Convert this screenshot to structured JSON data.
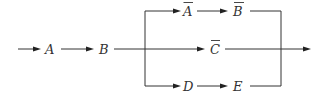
{
  "diagram": {
    "type": "reliability-block-diagram",
    "nodes": [
      {
        "id": "A",
        "label": "A",
        "complement": false
      },
      {
        "id": "B",
        "label": "B",
        "complement": false
      },
      {
        "id": "A_bar",
        "label": "A",
        "complement": true
      },
      {
        "id": "B_bar",
        "label": "B",
        "complement": true
      },
      {
        "id": "C_bar",
        "label": "C",
        "complement": true
      },
      {
        "id": "D",
        "label": "D",
        "complement": false
      },
      {
        "id": "E",
        "label": "E",
        "complement": false
      }
    ],
    "edges": [
      [
        "input",
        "A"
      ],
      [
        "A",
        "B"
      ],
      [
        "B",
        "A_bar"
      ],
      [
        "A_bar",
        "B_bar"
      ],
      [
        "B",
        "C_bar"
      ],
      [
        "B",
        "D"
      ],
      [
        "D",
        "E"
      ],
      [
        "B_bar",
        "output"
      ],
      [
        "C_bar",
        "output"
      ],
      [
        "E",
        "output"
      ]
    ],
    "colors": {
      "line": "#333333",
      "text": "#333333",
      "background": "#ffffff"
    }
  }
}
